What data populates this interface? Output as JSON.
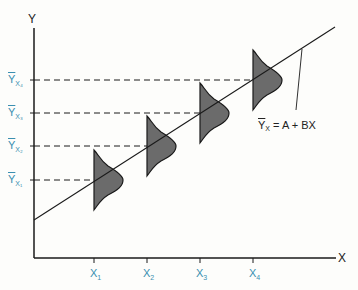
{
  "diagram": {
    "title": "",
    "axes": {
      "x_label": "X",
      "y_label": "Y"
    },
    "x_ticks": [
      {
        "base": "X",
        "sub": "1"
      },
      {
        "base": "X",
        "sub": "2"
      },
      {
        "base": "X",
        "sub": "3"
      },
      {
        "base": "X",
        "sub": "4"
      }
    ],
    "y_ticks": [
      {
        "base": "Y",
        "sub": "X₁"
      },
      {
        "base": "Y",
        "sub": "X₂"
      },
      {
        "base": "Y",
        "sub": "X₃"
      },
      {
        "base": "Y",
        "sub": "X₄"
      }
    ],
    "equation": {
      "lhs_base": "Y",
      "lhs_sub": "X",
      "rhs": " = A + BX"
    },
    "colors": {
      "label_blue": "#3a8fb0",
      "curve_fill": "#6b6b6b",
      "line": "#1a1a1a",
      "background": "#fdfdfb"
    },
    "elements": [
      "regression line",
      "4 conditional normal distributions",
      "dashed projection lines"
    ]
  }
}
